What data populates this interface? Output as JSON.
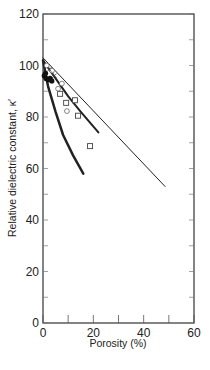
{
  "chart_data": {
    "type": "line",
    "title": "",
    "xlabel": "Porosity (%)",
    "ylabel": "Relative dielectric constant, κ′",
    "xlim": [
      0,
      60
    ],
    "ylim": [
      0,
      120
    ],
    "x_ticks": [
      0,
      20,
      40,
      60
    ],
    "x_minor_ticks": [
      10,
      30,
      50
    ],
    "y_ticks": [
      0,
      20,
      40,
      60,
      80,
      100,
      120
    ],
    "y_minor_ticks": [
      10,
      30,
      50,
      70,
      90,
      110
    ],
    "grid": false,
    "legend": null,
    "series": [
      {
        "name": "upper bound (thin line)",
        "style": "line",
        "width": 1,
        "points": [
          [
            0,
            103
          ],
          [
            48.5,
            53
          ]
        ]
      },
      {
        "name": "intermediate model (medium line)",
        "style": "line",
        "width": 2,
        "points": [
          [
            0,
            102
          ],
          [
            5,
            95
          ],
          [
            10,
            88
          ],
          [
            15,
            82
          ],
          [
            22,
            74
          ]
        ]
      },
      {
        "name": "lower bound (thick curve)",
        "style": "line",
        "width": 2.5,
        "points": [
          [
            0,
            102
          ],
          [
            2,
            92
          ],
          [
            5,
            82
          ],
          [
            8,
            73
          ],
          [
            12,
            65
          ],
          [
            16,
            58
          ]
        ]
      },
      {
        "name": "squares",
        "style": "marker-square",
        "points": [
          [
            6.8,
            89
          ],
          [
            9.2,
            85.5
          ],
          [
            12.7,
            86.5
          ],
          [
            13.9,
            80.5
          ],
          [
            18.7,
            68.7
          ]
        ]
      },
      {
        "name": "circles",
        "style": "marker-circle",
        "points": [
          [
            1.5,
            100
          ],
          [
            3.6,
            98
          ],
          [
            6,
            91
          ],
          [
            7.5,
            93
          ],
          [
            9.5,
            82.3
          ]
        ]
      },
      {
        "name": "crosses",
        "style": "marker-cross",
        "points": [
          [
            2.5,
            98.5
          ],
          [
            4.5,
            96
          ]
        ]
      },
      {
        "name": "filled",
        "style": "marker-filled",
        "points": [
          [
            0.5,
            96
          ],
          [
            1.2,
            95
          ],
          [
            2,
            94.5
          ],
          [
            2.8,
            95
          ],
          [
            3.5,
            94
          ],
          [
            1,
            97
          ]
        ]
      }
    ]
  }
}
